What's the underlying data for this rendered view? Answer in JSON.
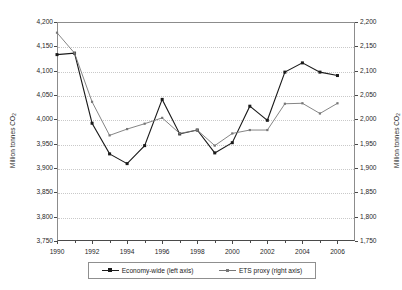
{
  "chart_data": {
    "type": "line",
    "title": "",
    "xlabel": "",
    "ylabel": "Million tonnes CO2",
    "y2label": "Million tonnes CO2",
    "grid": true,
    "legend_position": "bottom",
    "x": [
      1990,
      1991,
      1992,
      1993,
      1994,
      1995,
      1996,
      1997,
      1998,
      1999,
      2000,
      2001,
      2002,
      2003,
      2004,
      2005,
      2006
    ],
    "xlim": [
      1990,
      2007
    ],
    "xticks": [
      1990,
      1992,
      1994,
      1996,
      1998,
      2000,
      2002,
      2004,
      2006
    ],
    "xtick_labels": [
      "1990",
      "1992",
      "1994",
      "1996",
      "1998",
      "2000",
      "2002",
      "2004",
      "2006"
    ],
    "ylim": [
      3750,
      4200
    ],
    "yticks": [
      3750,
      3800,
      3850,
      3900,
      3950,
      4000,
      4050,
      4100,
      4150,
      4200
    ],
    "ytick_labels": [
      "3,750",
      "3,800",
      "3,850",
      "3,900",
      "3,950",
      "4,000",
      "4,050",
      "4,100",
      "4,150",
      "4,200"
    ],
    "y2lim": [
      1750,
      2200
    ],
    "y2ticks": [
      1750,
      1800,
      1850,
      1900,
      1950,
      2000,
      2050,
      2100,
      2150,
      2200
    ],
    "y2tick_labels": [
      "1,750",
      "1,800",
      "1,850",
      "1,900",
      "1,950",
      "2,000",
      "2,050",
      "2,100",
      "2,150",
      "2,200"
    ],
    "series": [
      {
        "name": "Economy-wide (left axis)",
        "axis": "left",
        "color": "#1a1a1a",
        "marker": "square",
        "values": [
          4133,
          4136,
          3992,
          3929,
          3909,
          3946,
          4041,
          3970,
          3978,
          3931,
          3952,
          4027,
          3998,
          4097,
          4116,
          4097,
          4090
        ]
      },
      {
        "name": "ETS proxy (right axis)",
        "axis": "right",
        "color": "#777777",
        "marker": "square-small",
        "values": [
          2178,
          2136,
          2036,
          1967,
          1980,
          1991,
          2003,
          1971,
          1978,
          1946,
          1971,
          1978,
          1978,
          2032,
          2033,
          2012,
          2033
        ]
      }
    ]
  },
  "axes": {
    "left_title_main": "Million tonnes CO",
    "left_title_sub": "2",
    "right_title_main": "Million tonnes CO",
    "right_title_sub": "2"
  },
  "legend": {
    "items": [
      {
        "label": "Economy-wide (left axis)"
      },
      {
        "label": "ETS proxy (right axis)"
      }
    ]
  }
}
